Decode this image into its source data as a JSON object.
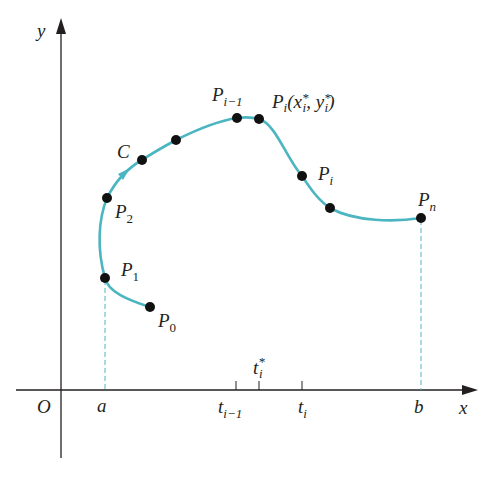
{
  "diagram": {
    "colors": {
      "curve": "#4bb5c1",
      "axes": "#231f20",
      "points": "#111111",
      "dashed": "#4bb5c1"
    },
    "axes": {
      "x_label": "x",
      "y_label": "y",
      "origin_label": "O"
    },
    "curve": {
      "name": "C",
      "points": [
        {
          "id": "P0",
          "label": "P",
          "sub": "0"
        },
        {
          "id": "P1",
          "label": "P",
          "sub": "1"
        },
        {
          "id": "P2",
          "label": "P",
          "sub": "2"
        },
        {
          "id": "Pim1",
          "label": "P",
          "sub": "i−1"
        },
        {
          "id": "Pstar",
          "label": "P",
          "sub": "i",
          "suffix": "(x",
          "suffix_sub": "i",
          "suffix_sup": "*",
          "suffix2": ", y",
          "suffix2_sub": "i",
          "suffix2_sup": "*",
          "suffix3": ")"
        },
        {
          "id": "Pi",
          "label": "P",
          "sub": "i"
        },
        {
          "id": "Pn",
          "label": "P",
          "sub": "n"
        }
      ]
    },
    "x_axis_ticks": [
      {
        "label": "a"
      },
      {
        "label": "t",
        "sub": "i−1"
      },
      {
        "label": "t",
        "sub": "i",
        "sup": "*"
      },
      {
        "label": "t",
        "sub": "i"
      },
      {
        "label": "b"
      }
    ]
  }
}
